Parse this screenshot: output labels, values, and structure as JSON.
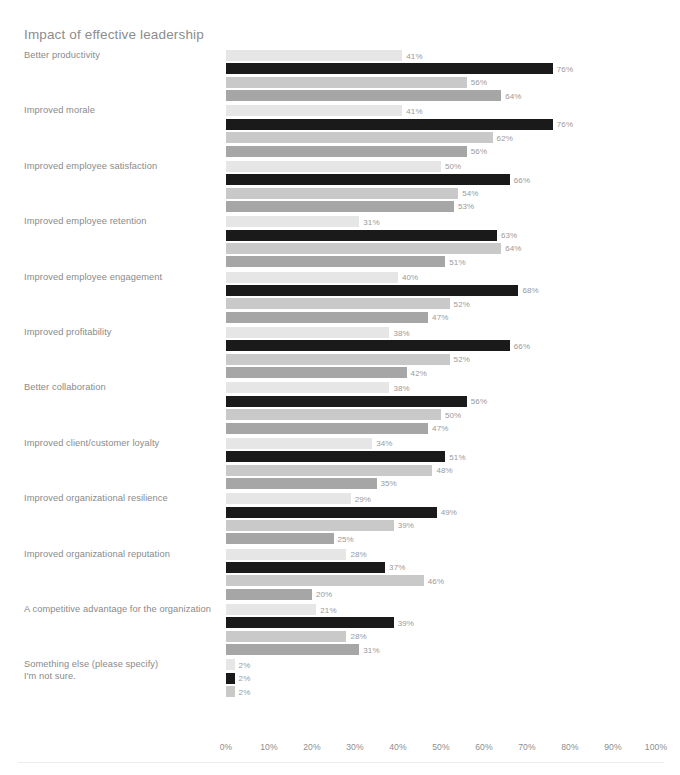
{
  "chart_data": {
    "type": "bar",
    "orientation": "horizontal",
    "title": "Impact of effective leadership",
    "xlabel": "",
    "ylabel": "",
    "xlim": [
      0,
      100
    ],
    "grid": false,
    "legend": "none",
    "value_suffix": "%",
    "tick_labels": [
      "0%",
      "10%",
      "20%",
      "30%",
      "40%",
      "50%",
      "60%",
      "70%",
      "80%",
      "90%",
      "100%"
    ],
    "tick_values": [
      0,
      10,
      20,
      30,
      40,
      50,
      60,
      70,
      80,
      90,
      100
    ],
    "series_colors": [
      "#e6e6e6",
      "#1a1a1a",
      "#c9c9c9",
      "#a6a6a6"
    ],
    "categories": [
      "Better productivity",
      "Improved morale",
      "Improved employee satisfaction",
      "Improved employee retention",
      "Improved employee engagement",
      "Improved profitability",
      "Better collaboration",
      "Improved client/customer loyalty",
      "Improved organizational resilience",
      "Improved organizational reputation",
      "A competitive advantage for the organization",
      "Something else (please specify)"
    ],
    "extra_category": "I'm not sure.",
    "groups": [
      {
        "label": "Better productivity",
        "values": [
          41,
          76,
          56,
          64
        ]
      },
      {
        "label": "Improved morale",
        "values": [
          41,
          76,
          62,
          56
        ]
      },
      {
        "label": "Improved employee satisfaction",
        "values": [
          50,
          66,
          54,
          53
        ]
      },
      {
        "label": "Improved employee retention",
        "values": [
          31,
          63,
          64,
          51
        ]
      },
      {
        "label": "Improved employee engagement",
        "values": [
          40,
          68,
          52,
          47
        ]
      },
      {
        "label": "Improved profitability",
        "values": [
          38,
          66,
          52,
          42
        ]
      },
      {
        "label": "Better collaboration",
        "values": [
          38,
          56,
          50,
          47
        ]
      },
      {
        "label": "Improved client/customer loyalty",
        "values": [
          34,
          51,
          48,
          35
        ]
      },
      {
        "label": "Improved organizational resilience",
        "values": [
          29,
          49,
          39,
          25
        ]
      },
      {
        "label": "Improved organizational reputation",
        "values": [
          28,
          37,
          46,
          20
        ]
      },
      {
        "label": "A competitive advantage for the organization",
        "values": [
          21,
          39,
          28,
          31
        ]
      },
      {
        "label": "Something else (please specify)",
        "label2": "I'm not sure.",
        "values": [
          2,
          2,
          2
        ]
      }
    ]
  }
}
